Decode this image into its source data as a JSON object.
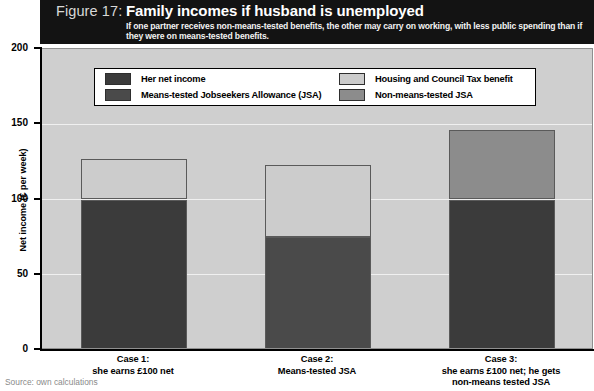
{
  "header": {
    "figure_label": "Figure 17:",
    "title": "Family incomes if husband is unemployed",
    "subtitle": "If one partner receives non-means-tested benefits, the other may carry on working, with less public spending than if they were on means-tested benefits."
  },
  "legend": {
    "items": [
      {
        "label": "Her net income",
        "color": "#3b3b3b"
      },
      {
        "label": "Means-tested Jobseekers Allowance (JSA)",
        "color": "#4a4a4a"
      },
      {
        "label": "Housing and Council Tax benefit",
        "color": "#cccccc"
      },
      {
        "label": "Non-means-tested JSA",
        "color": "#8c8c8c"
      }
    ]
  },
  "source": "Source: own calculations",
  "chart_data": {
    "type": "bar",
    "stacked": true,
    "title": "Family incomes if husband is unemployed",
    "xlabel": "",
    "ylabel": "Net income (£ per week)",
    "ylim": [
      0,
      200
    ],
    "yticks": [
      "0",
      "50",
      "100",
      "150",
      "200"
    ],
    "ytick_values": [
      0,
      50,
      100,
      150,
      200
    ],
    "grid": true,
    "legend_position": "top",
    "categories": [
      {
        "name": "Case 1:",
        "desc": "she earns £100 net"
      },
      {
        "name": "Case 2:",
        "desc": "Means-tested JSA"
      },
      {
        "name": "Case 3:",
        "desc": "she earns £100 net; he gets\nnon-means tested JSA"
      }
    ],
    "category_labels": [
      "Case 1: she earns £100 net",
      "Case 2: Means-tested JSA",
      "Case 3: she earns £100 net; he gets non-means tested JSA"
    ],
    "series": [
      {
        "name": "Her net income",
        "color": "#3b3b3b",
        "values": [
          100,
          0,
          100
        ]
      },
      {
        "name": "Means-tested Jobseekers Allowance (JSA)",
        "color": "#4a4a4a",
        "values": [
          0,
          75,
          0
        ]
      },
      {
        "name": "Housing and Council Tax benefit",
        "color": "#cccccc",
        "values": [
          27,
          48,
          0
        ]
      },
      {
        "name": "Non-means-tested JSA",
        "color": "#8c8c8c",
        "values": [
          0,
          0,
          46
        ]
      }
    ],
    "totals": [
      127,
      123,
      146
    ],
    "bars": [
      {
        "category": "Case 1",
        "total": 127,
        "segments": [
          {
            "series": "Her net income",
            "value": 100,
            "color": "#3b3b3b"
          },
          {
            "series": "Housing and Council Tax benefit",
            "value": 27,
            "color": "#cccccc"
          }
        ]
      },
      {
        "category": "Case 2",
        "total": 123,
        "segments": [
          {
            "series": "Means-tested Jobseekers Allowance (JSA)",
            "value": 75,
            "color": "#4a4a4a"
          },
          {
            "series": "Housing and Council Tax benefit",
            "value": 48,
            "color": "#cccccc"
          }
        ]
      },
      {
        "category": "Case 3",
        "total": 146,
        "segments": [
          {
            "series": "Her net income",
            "value": 100,
            "color": "#3b3b3b"
          },
          {
            "series": "Non-means-tested JSA",
            "value": 46,
            "color": "#8c8c8c"
          }
        ]
      }
    ]
  }
}
